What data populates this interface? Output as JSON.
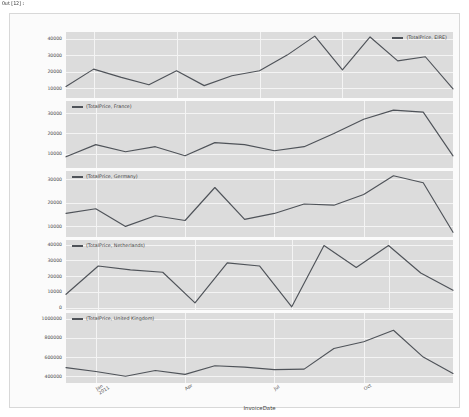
{
  "notebook": {
    "header_text": "Out[12]:"
  },
  "chart_data": {
    "type": "line",
    "title": "",
    "xlabel": "InvoiceDate",
    "ylabel": "",
    "grid": true,
    "legend_position": "inside-panel",
    "x_tick_labels": [
      "Jan\n2011",
      "Apr",
      "Jul",
      "Oct"
    ],
    "x_tick_major": [
      "Jan",
      "Apr",
      "Jul",
      "Oct"
    ],
    "x_tick_year": "2011",
    "x": [
      0,
      1,
      2,
      3,
      4,
      5,
      6,
      7,
      8,
      9,
      10,
      11,
      12,
      13
    ],
    "line_color": "#4f5359",
    "panels": [
      {
        "name": "eire-panel",
        "legend": "(TotalPrice, EIRE)",
        "legend_side": "right",
        "ylim": [
          4000,
          44000
        ],
        "yticks": [
          10000,
          20000,
          30000,
          40000
        ],
        "ytick_labels": [
          "10000",
          "20000",
          "30000",
          "40000"
        ],
        "values": [
          11000,
          21500,
          16500,
          12000,
          20500,
          11500,
          17500,
          20500,
          30000,
          41500,
          21000,
          41000,
          26500,
          29000,
          9500
        ]
      },
      {
        "name": "france-panel",
        "legend": "(TotalPrice, France)",
        "legend_side": "left",
        "ylim": [
          3000,
          36000
        ],
        "yticks": [
          10000,
          20000,
          30000
        ],
        "ytick_labels": [
          "10000",
          "20000",
          "30000"
        ],
        "values": [
          8500,
          14500,
          11000,
          13500,
          9000,
          15500,
          14500,
          11500,
          13500,
          20000,
          27000,
          31500,
          30500,
          9000
        ]
      },
      {
        "name": "germany-panel",
        "legend": "(TotalPrice, Germany)",
        "legend_side": "left",
        "ylim": [
          5500,
          33500
        ],
        "yticks": [
          10000,
          20000,
          30000
        ],
        "ytick_labels": [
          "10000",
          "20000",
          "30000"
        ],
        "values": [
          15500,
          17500,
          10000,
          14500,
          12500,
          26500,
          13000,
          15500,
          19500,
          19000,
          23500,
          31500,
          28500,
          7500
        ]
      },
      {
        "name": "netherlands-panel",
        "legend": "(TotalPrice, Netherlands)",
        "legend_side": "left",
        "ylim": [
          -1500,
          43000
        ],
        "yticks": [
          0,
          10000,
          20000,
          30000,
          40000
        ],
        "ytick_labels": [
          "0",
          "10000",
          "20000",
          "30000",
          "40000"
        ],
        "values": [
          8500,
          26500,
          24000,
          22500,
          3000,
          28500,
          26500,
          500,
          39500,
          25500,
          39500,
          22000,
          11000
        ]
      },
      {
        "name": "united-kingdom-panel",
        "legend": "(TotalPrice, United Kingdom)",
        "legend_side": "left",
        "ylim": [
          330000,
          1060000
        ],
        "yticks": [
          400000,
          600000,
          800000,
          1000000
        ],
        "ytick_labels": [
          "400000",
          "600000",
          "800000",
          "1000000"
        ],
        "values": [
          490000,
          450000,
          400000,
          460000,
          420000,
          510000,
          495000,
          470000,
          475000,
          690000,
          760000,
          880000,
          600000,
          430000
        ]
      }
    ]
  }
}
